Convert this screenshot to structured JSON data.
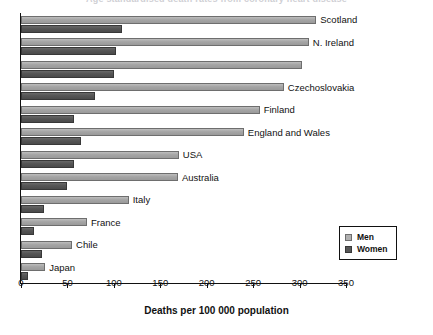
{
  "chart_data": {
    "type": "bar",
    "orientation": "horizontal",
    "title": "",
    "xlabel": "Deaths per 100 000 population",
    "ylabel": "",
    "xlim": [
      0,
      350
    ],
    "xticks": [
      0,
      50,
      100,
      150,
      200,
      250,
      300,
      350
    ],
    "grid": false,
    "legend_position": "lower-right",
    "categories": [
      "Scotland",
      "N. Ireland",
      "",
      "Czechoslovakia",
      "Finland",
      "England and Wales",
      "USA",
      "Australia",
      "Italy",
      "France",
      "Chile",
      "Japan"
    ],
    "series": [
      {
        "name": "Men",
        "color": "#a8a8a8",
        "values": [
          318,
          310,
          303,
          283,
          257,
          240,
          170,
          169,
          116,
          71,
          55,
          26
        ]
      },
      {
        "name": "Women",
        "color": "#575757",
        "values": [
          109,
          102,
          100,
          80,
          57,
          65,
          57,
          49,
          25,
          14,
          23,
          7
        ]
      }
    ]
  },
  "legend": {
    "entries": [
      {
        "label": "Men",
        "swatch": "men"
      },
      {
        "label": "Women",
        "swatch": "women"
      }
    ]
  },
  "axis": {
    "x_title": "Deaths per 100 000 population",
    "tick_labels": [
      "0",
      "50",
      "100",
      "150",
      "200",
      "250",
      "300",
      "350"
    ]
  },
  "clipped_header": {
    "text": "Age standardised death rates from coronary heart disease"
  }
}
